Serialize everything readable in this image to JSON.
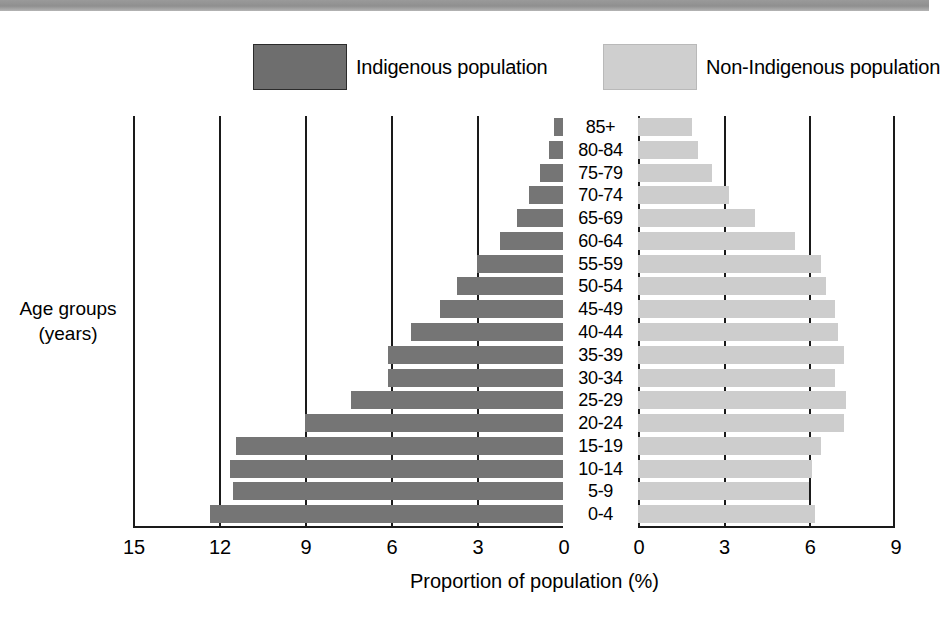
{
  "legend": {
    "indigenous_label": "Indigenous population",
    "nonindigenous_label": "Non-Indigenous population",
    "indigenous_color": "#757575",
    "nonindigenous_color": "#cdcdcd"
  },
  "axes": {
    "y_title_line1": "Age groups",
    "y_title_line2": "(years)",
    "x_title": "Proportion of population (%)",
    "left_ticks": [
      "15",
      "12",
      "9",
      "6",
      "3",
      "0"
    ],
    "right_ticks": [
      "0",
      "3",
      "6",
      "9"
    ]
  },
  "chart_data": {
    "type": "bar",
    "title": "",
    "subtitle": "",
    "xlabel": "Proportion of population (%)",
    "ylabel": "Age groups (years)",
    "orientation": "horizontal",
    "layout": "population-pyramid",
    "grid": true,
    "legend_position": "top",
    "left_axis_range": [
      15,
      0
    ],
    "right_axis_range": [
      0,
      9
    ],
    "left_axis_ticks": [
      15,
      12,
      9,
      6,
      3,
      0
    ],
    "right_axis_ticks": [
      0,
      3,
      6,
      9
    ],
    "categories": [
      "85+",
      "80-84",
      "75-79",
      "70-74",
      "65-69",
      "60-64",
      "55-59",
      "50-54",
      "45-49",
      "40-44",
      "35-39",
      "30-34",
      "25-29",
      "20-24",
      "15-19",
      "10-14",
      "5-9",
      "0-4"
    ],
    "series": [
      {
        "name": "Indigenous population",
        "axis": "left",
        "color": "#757575",
        "values": [
          0.3,
          0.5,
          0.8,
          1.2,
          1.6,
          2.2,
          3.0,
          3.7,
          4.3,
          5.3,
          6.1,
          6.1,
          7.4,
          9.0,
          11.4,
          11.6,
          11.5,
          12.3
        ]
      },
      {
        "name": "Non-Indigenous population",
        "axis": "right",
        "color": "#cdcdcd",
        "values": [
          1.9,
          2.1,
          2.6,
          3.2,
          4.1,
          5.5,
          6.4,
          6.6,
          6.9,
          7.0,
          7.2,
          6.9,
          7.3,
          7.2,
          6.4,
          6.1,
          6.0,
          6.2
        ]
      }
    ]
  }
}
